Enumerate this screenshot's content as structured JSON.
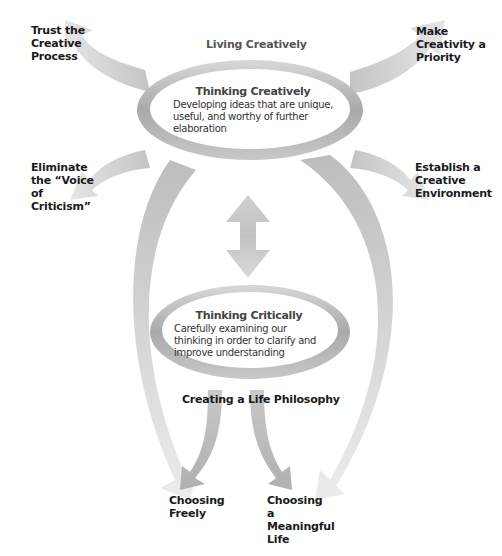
{
  "diagram": {
    "top_title": "Living Creatively",
    "upper_oval": {
      "heading": "Thinking Creatively",
      "description": "Developing ideas that are unique, useful, and worthy of further elaboration"
    },
    "lower_oval": {
      "heading": "Thinking Critically",
      "description": "Carefully examining our thinking in order to clarify and improve understanding"
    },
    "bottom_title": "Creating a Life Philosophy",
    "corner_labels": {
      "top_left": "Trust the Creative Process",
      "top_right": "Make Creativity a Priority",
      "mid_left": "Eliminate the “Voice of Criticism”",
      "mid_right": "Establish a Creative Environment"
    },
    "outcomes": {
      "left": "Choosing Freely",
      "right": "Choosing a Meaningful Life"
    },
    "colors": {
      "arrow_light": "#e2e2e2",
      "arrow_dark": "#bdbdbd",
      "ring_dark": "#a8a8a8",
      "ring_light": "#f0f0f0",
      "text": "#1a1a1a"
    }
  }
}
